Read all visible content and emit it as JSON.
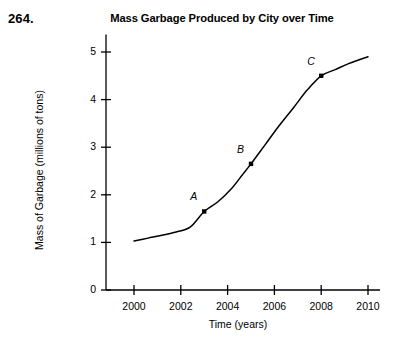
{
  "problem_number": "264.",
  "chart_data": {
    "type": "line",
    "title": "Mass Garbage Produced by City over Time",
    "xlabel": "Time (years)",
    "ylabel": "Mass of Garbage (millions of tons)",
    "xlim": [
      1999,
      2010.4
    ],
    "ylim": [
      0,
      5.2
    ],
    "xticks": [
      2000,
      2002,
      2004,
      2006,
      2008,
      2010
    ],
    "xtick_labels": [
      "2000",
      "2002",
      "2004",
      "2006",
      "2008",
      "2010"
    ],
    "yticks": [
      0,
      1,
      2,
      3,
      4,
      5
    ],
    "ytick_labels": [
      "0",
      "1",
      "2",
      "3",
      "4",
      "5"
    ],
    "grid": false,
    "legend": "none",
    "line_color": "#000000",
    "x": [
      2000.0,
      2000.6,
      2001.2,
      2001.8,
      2002.4,
      2003.0,
      2003.6,
      2004.2,
      2004.6,
      2005.0,
      2005.6,
      2006.2,
      2006.8,
      2007.4,
      2008.0,
      2008.6,
      2009.2,
      2010.0
    ],
    "values": [
      1.03,
      1.09,
      1.15,
      1.22,
      1.32,
      1.65,
      1.86,
      2.15,
      2.4,
      2.65,
      3.05,
      3.45,
      3.82,
      4.2,
      4.5,
      4.63,
      4.76,
      4.9
    ],
    "annotations": [
      {
        "label": "A",
        "x": 2003,
        "y": 1.65
      },
      {
        "label": "B",
        "x": 2005,
        "y": 2.65
      },
      {
        "label": "C",
        "x": 2008,
        "y": 4.5
      }
    ]
  }
}
